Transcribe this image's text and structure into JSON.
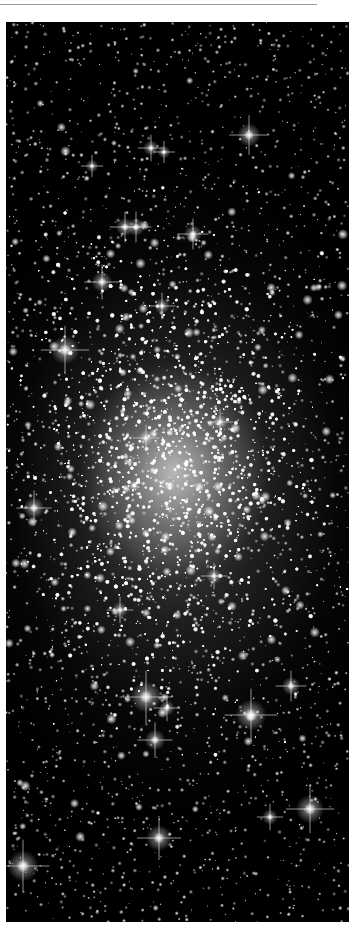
{
  "page": {
    "background": "#ffffff",
    "rule_color": "#9a9a9a"
  },
  "image": {
    "subject": "globular star cluster",
    "alt": "Dense globular star cluster with bright foreground stars showing diffraction spikes on black sky",
    "background_color": "#000000",
    "star_color": "#ffffff",
    "core_center": [
      168,
      450
    ],
    "bright_stars": [
      {
        "x": 243,
        "y": 113,
        "size": 9
      },
      {
        "x": 145,
        "y": 126,
        "size": 6
      },
      {
        "x": 158,
        "y": 130,
        "size": 5
      },
      {
        "x": 86,
        "y": 144,
        "size": 5
      },
      {
        "x": 119,
        "y": 205,
        "size": 7
      },
      {
        "x": 130,
        "y": 205,
        "size": 7
      },
      {
        "x": 187,
        "y": 212,
        "size": 7
      },
      {
        "x": 96,
        "y": 260,
        "size": 8
      },
      {
        "x": 156,
        "y": 284,
        "size": 6
      },
      {
        "x": 59,
        "y": 328,
        "size": 11
      },
      {
        "x": 140,
        "y": 416,
        "size": 6
      },
      {
        "x": 214,
        "y": 400,
        "size": 6
      },
      {
        "x": 28,
        "y": 486,
        "size": 8
      },
      {
        "x": 208,
        "y": 554,
        "size": 6
      },
      {
        "x": 114,
        "y": 588,
        "size": 6
      },
      {
        "x": 140,
        "y": 675,
        "size": 12
      },
      {
        "x": 161,
        "y": 686,
        "size": 6
      },
      {
        "x": 245,
        "y": 693,
        "size": 12
      },
      {
        "x": 285,
        "y": 664,
        "size": 7
      },
      {
        "x": 149,
        "y": 718,
        "size": 8
      },
      {
        "x": 304,
        "y": 787,
        "size": 11
      },
      {
        "x": 264,
        "y": 795,
        "size": 6
      },
      {
        "x": 153,
        "y": 816,
        "size": 10
      },
      {
        "x": 17,
        "y": 844,
        "size": 12
      }
    ]
  }
}
